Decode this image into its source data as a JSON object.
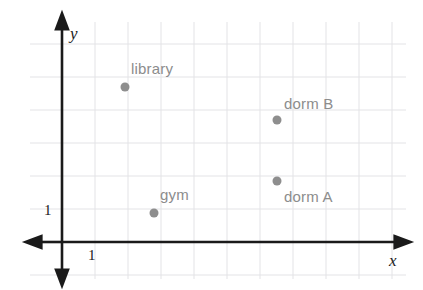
{
  "figure": {
    "background_color": "#ffffff",
    "grid_color": "#e3e3e6",
    "axis_color": "#1a1a1a",
    "point_color": "#8e8e8e",
    "label_color": "#8c8c8c"
  },
  "axes": {
    "x_label": "x",
    "y_label": "y",
    "x_unit_label": "1",
    "y_unit_label": "1",
    "origin_px": {
      "x": 62,
      "y": 242
    },
    "unit_px": 33
  },
  "chart_data": {
    "type": "scatter",
    "title": "",
    "xlabel": "x",
    "ylabel": "y",
    "xlim": [
      0,
      10
    ],
    "ylim": [
      0,
      7
    ],
    "grid": true,
    "legend": "none",
    "unit_tick_x": 1,
    "unit_tick_y": 1,
    "points": [
      {
        "name": "library",
        "label": "library",
        "x": 2,
        "y": 4.7,
        "px": {
          "x": 125,
          "y": 87
        },
        "label_px": {
          "x": 131,
          "y": 60
        }
      },
      {
        "name": "dorm B",
        "label": "dorm B",
        "x": 6.5,
        "y": 3.7,
        "px": {
          "x": 277,
          "y": 120
        },
        "label_px": {
          "x": 284,
          "y": 95
        }
      },
      {
        "name": "dorm A",
        "label": "dorm A",
        "x": 6.5,
        "y": 1.85,
        "px": {
          "x": 277,
          "y": 181
        },
        "label_px": {
          "x": 284,
          "y": 188
        }
      },
      {
        "name": "gym",
        "label": "gym",
        "x": 2.8,
        "y": 0.9,
        "px": {
          "x": 154,
          "y": 213
        },
        "label_px": {
          "x": 160,
          "y": 186
        }
      }
    ]
  }
}
